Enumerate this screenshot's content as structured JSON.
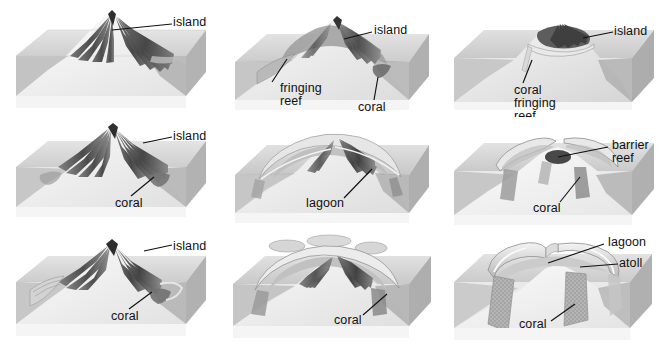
{
  "figure": {
    "type": "block-diagram-series",
    "columns": 3,
    "rows": 3,
    "palette": {
      "background": "#ffffff",
      "block_top": "#d8d8d8",
      "block_front": "#c3c3c3",
      "block_side": "#b0b0b0",
      "water_fill": "#cfcfcf",
      "volcano_light": "#f0f0f0",
      "volcano_shadow": "#9a9a9a",
      "reef_dark": "#5a5a5a",
      "reef_mid": "#8d8d8d",
      "line": "#111111"
    }
  },
  "panels": [
    {
      "id": "panel-1",
      "stage": "volcanic-island-emerges",
      "labels": [
        {
          "name": "island",
          "text": "island"
        }
      ]
    },
    {
      "id": "panel-2",
      "stage": "fringing-reef-forms",
      "labels": [
        {
          "name": "island",
          "text": "island"
        },
        {
          "name": "fringing-reef",
          "text": "fringing\nreef"
        },
        {
          "name": "coral",
          "text": "coral"
        }
      ]
    },
    {
      "id": "panel-3",
      "stage": "coral-fringing-reef",
      "labels": [
        {
          "name": "island",
          "text": "island"
        },
        {
          "name": "coral-fringing-reef",
          "text": "coral\nfringing\nreef"
        }
      ]
    },
    {
      "id": "panel-4",
      "stage": "island-subsides-coral-grows",
      "labels": [
        {
          "name": "island",
          "text": "island"
        },
        {
          "name": "coral",
          "text": "coral"
        }
      ]
    },
    {
      "id": "panel-5",
      "stage": "lagoon-develops",
      "labels": [
        {
          "name": "lagoon",
          "text": "lagoon"
        }
      ]
    },
    {
      "id": "panel-6",
      "stage": "barrier-reef-stage",
      "labels": [
        {
          "name": "barrier-reef",
          "text": "barrier\nreef"
        },
        {
          "name": "coral",
          "text": "coral"
        }
      ]
    },
    {
      "id": "panel-7",
      "stage": "island-further-subsides",
      "labels": [
        {
          "name": "island",
          "text": "island"
        },
        {
          "name": "coral",
          "text": "coral"
        }
      ]
    },
    {
      "id": "panel-8",
      "stage": "reef-ring-closes",
      "labels": [
        {
          "name": "coral",
          "text": "coral"
        }
      ]
    },
    {
      "id": "panel-9",
      "stage": "atoll-formed",
      "labels": [
        {
          "name": "lagoon",
          "text": "lagoon"
        },
        {
          "name": "atoll",
          "text": "atoll"
        },
        {
          "name": "coral",
          "text": "coral"
        }
      ]
    }
  ]
}
